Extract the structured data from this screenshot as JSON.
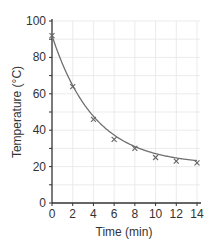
{
  "chart_data": {
    "type": "line",
    "title": "",
    "xlabel": "Time (min)",
    "ylabel": "Temperature (°C)",
    "x": [
      0,
      2,
      4,
      6,
      8,
      10,
      12,
      14
    ],
    "series": [
      {
        "name": "Temperature",
        "values": [
          92,
          64,
          46,
          35,
          30,
          25,
          23,
          22
        ],
        "marker": "x",
        "color": "#707070"
      }
    ],
    "xticks": [
      0,
      2,
      4,
      6,
      8,
      10,
      12,
      14
    ],
    "yticks": [
      0,
      20,
      40,
      60,
      80,
      100
    ],
    "xlim": [
      0,
      14
    ],
    "ylim": [
      0,
      100
    ],
    "grid": true,
    "fit_curve": "exponential decay"
  },
  "axis_color": "#333333",
  "grid_color": "#e6e6e6",
  "line_color": "#707070"
}
